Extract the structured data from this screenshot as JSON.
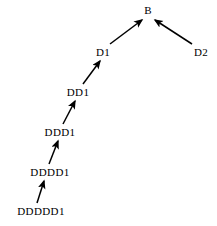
{
  "diagram": {
    "type": "directed-acyclic-graph",
    "background_color": "#ffffff",
    "edge_color": "#000000",
    "label_color": "#000000",
    "nodes": [
      {
        "id": "B",
        "label": "B",
        "x": 148,
        "y": 10
      },
      {
        "id": "D1",
        "label": "D1",
        "x": 103,
        "y": 52
      },
      {
        "id": "D2",
        "label": "D2",
        "x": 201,
        "y": 52
      },
      {
        "id": "DD1",
        "label": "DD1",
        "x": 78,
        "y": 92
      },
      {
        "id": "DDD1",
        "label": "DDD1",
        "x": 60,
        "y": 132
      },
      {
        "id": "DDDD1",
        "label": "DDDD1",
        "x": 50,
        "y": 172
      },
      {
        "id": "DDDDD1",
        "label": "DDDDD1",
        "x": 41,
        "y": 211
      }
    ],
    "edges": [
      {
        "from": "D1",
        "to": "B",
        "x1": 110,
        "y1": 44,
        "x2": 142,
        "y2": 20
      },
      {
        "from": "D2",
        "to": "B",
        "x1": 192,
        "y1": 44,
        "x2": 155,
        "y2": 20
      },
      {
        "from": "DD1",
        "to": "D1",
        "x1": 83,
        "y1": 84,
        "x2": 100,
        "y2": 61
      },
      {
        "from": "DDD1",
        "to": "DD1",
        "x1": 63,
        "y1": 124,
        "x2": 75,
        "y2": 101
      },
      {
        "from": "DDDD1",
        "to": "DDD1",
        "x1": 49,
        "y1": 164,
        "x2": 58,
        "y2": 141
      },
      {
        "from": "DDDDD1",
        "to": "DDDD1",
        "x1": 37,
        "y1": 203,
        "x2": 44,
        "y2": 181
      }
    ]
  }
}
